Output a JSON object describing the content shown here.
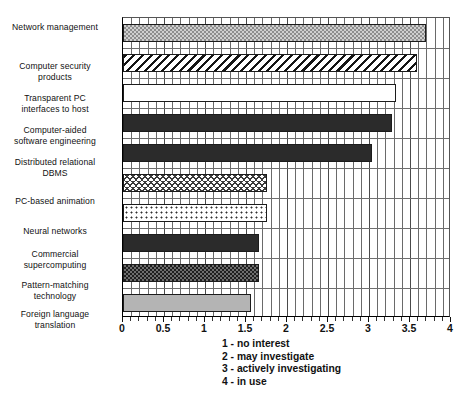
{
  "chart_data": {
    "type": "bar",
    "orientation": "horizontal",
    "title": "",
    "xlabel": "",
    "ylabel": "",
    "xlim": [
      0,
      4
    ],
    "xticks": [
      0,
      0.5,
      1,
      1.5,
      2,
      2.5,
      3,
      3.5,
      4
    ],
    "xticklabels": [
      "0",
      "0.5",
      "1",
      "1.5",
      "2",
      "2.5",
      "3",
      "3.5",
      "4"
    ],
    "minor_tick_step": 0.1,
    "grid": true,
    "grid_axis": "x",
    "legend_position": "below-axis-center",
    "categories": [
      "Network management",
      "Computer security products",
      "Transparent PC interfaces to host",
      "Computer-aided software engineering",
      "Distributed relational DBMS",
      "PC-based animation",
      "Neural networks",
      "Commercial supercomputing",
      "Pattern-matching technology",
      "Foreign language translation"
    ],
    "category_lines": [
      [
        "Network management"
      ],
      [
        "Computer security",
        "products"
      ],
      [
        "Transparent PC",
        "interfaces to host"
      ],
      [
        "Computer-aided",
        "software engineering"
      ],
      [
        "Distributed relational",
        "DBMS"
      ],
      [
        "PC-based animation"
      ],
      [
        "Neural networks"
      ],
      [
        "Commercial",
        "supercomputing"
      ],
      [
        "Pattern-matching",
        "technology"
      ],
      [
        "Foreign language",
        "translation"
      ]
    ],
    "values": [
      3.7,
      3.58,
      3.33,
      3.28,
      3.04,
      1.75,
      1.76,
      1.66,
      1.66,
      1.56
    ],
    "bar_patterns": [
      "fine-checkered-light",
      "diagonal-hatch",
      "white-plain",
      "solid-dark",
      "solid-dark",
      "zigzag-scales",
      "small-dots",
      "solid-dark",
      "checkered-dark",
      "solid-light-gray"
    ],
    "legend_entries": [
      "1 - no interest",
      "2 - may investigate",
      "3 - actively investigating",
      "4 - in use"
    ]
  },
  "colors": {
    "axis": "#111111",
    "gridline": "#6a6a6a",
    "bar_dark": "#2b2b2b",
    "bar_gray": "#b4b4b4",
    "background": "#ffffff"
  }
}
